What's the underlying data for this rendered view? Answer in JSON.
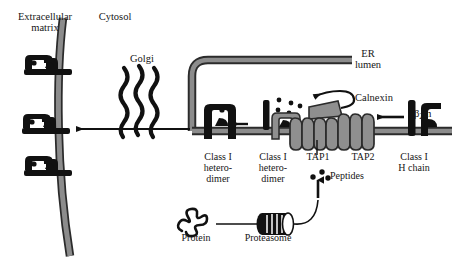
{
  "figure": {
    "type": "cell-biology-diagram",
    "width": 452,
    "height": 259,
    "background": "#ffffff"
  },
  "colors": {
    "membrane_fill": "#8c8c8c",
    "membrane_edge": "#2b2b2b",
    "protein_black": "#111111",
    "complex_gray": "#8f8f8f",
    "text": "#161616",
    "arrow": "#111111"
  },
  "labels": {
    "extracellular_matrix": "Extracellular\nmatrix",
    "cytosol": "Cytosol",
    "golgi": "Golgi",
    "er_lumen": "ER\nlumen",
    "calnexin": "Calnexin",
    "beta2m_main": "m",
    "beta2m_greek": "β",
    "beta2m_sub": "2",
    "class_i_heterodimer_surface": "Class I\nhetero-\ndimer",
    "class_i_heterodimer_er": "Class I\nhetero-\ndimer",
    "tap1": "TAP1",
    "tap2": "TAP2",
    "class_i_h_chain": "Class I\nH chain",
    "peptides": "Peptides",
    "protein": "Protein",
    "proteasome": "Proteasome"
  },
  "structures": {
    "plasma_membrane": {
      "name": "plasma membrane",
      "orientation": "vertical",
      "curved": true,
      "mhc_complex_count": 3
    },
    "golgi": {
      "name": "Golgi apparatus",
      "squiggle_count": 3
    },
    "er": {
      "name": "endoplasmic reticulum",
      "shape": "inverted-U cisterna"
    },
    "tap_transporter": {
      "name": "TAP1/TAP2 peptide transporter",
      "helix_loops": 9
    },
    "peptide_dots": 3,
    "proteasome": {
      "name": "proteasome",
      "shape": "striped barrel"
    }
  },
  "arrows": [
    {
      "name": "golgi-to-surface",
      "direction": "left"
    },
    {
      "name": "er-to-golgi",
      "direction": "left"
    },
    {
      "name": "loading-complex-to-classI",
      "direction": "left"
    },
    {
      "name": "hchain-to-loading",
      "direction": "left"
    },
    {
      "name": "peptides-into-er",
      "direction": "up"
    },
    {
      "name": "proteasome-to-peptides",
      "direction": "curved-up"
    },
    {
      "name": "peptide-into-complex",
      "direction": "curved-left"
    }
  ]
}
